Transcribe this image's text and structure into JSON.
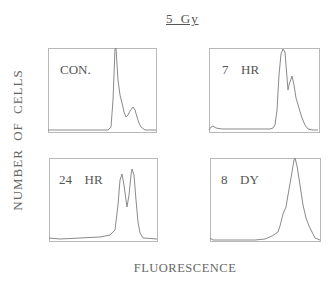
{
  "figure": {
    "title": "5 Gy",
    "ylabel": "NUMBER OF CELLS",
    "xlabel": "FLUORESCENCE"
  },
  "panels": [
    {
      "label": "CON.",
      "box": [
        48,
        48,
        108,
        84
      ]
    },
    {
      "label": "7  HR",
      "box": [
        209,
        48,
        110,
        84
      ]
    },
    {
      "label": "24  HR",
      "box": [
        49,
        158,
        108,
        83
      ]
    },
    {
      "label": "8  DY",
      "box": [
        210,
        158,
        110,
        83
      ]
    }
  ],
  "chart_data": [
    {
      "type": "line",
      "title": "CON.",
      "xlabel": "FLUORESCENCE",
      "ylabel": "NUMBER OF CELLS",
      "grid": false,
      "x": [
        0,
        50,
        58,
        60,
        62,
        64,
        66,
        68,
        70,
        72,
        74,
        76,
        78,
        80,
        82,
        84,
        86,
        88,
        90,
        92,
        95,
        100
      ],
      "y": [
        0,
        0,
        2,
        40,
        100,
        80,
        50,
        40,
        25,
        16,
        15,
        20,
        28,
        30,
        26,
        18,
        10,
        5,
        3,
        1,
        0,
        0
      ],
      "path_px": [
        [
          48,
          130
        ],
        [
          108,
          130
        ],
        [
          111,
          127
        ],
        [
          113,
          100
        ],
        [
          115,
          49
        ],
        [
          116,
          48
        ],
        [
          118,
          80
        ],
        [
          120,
          95
        ],
        [
          122,
          103
        ],
        [
          124,
          112
        ],
        [
          126,
          117
        ],
        [
          128,
          115
        ],
        [
          130,
          111
        ],
        [
          133,
          107
        ],
        [
          135,
          110
        ],
        [
          137,
          117
        ],
        [
          139,
          123
        ],
        [
          141,
          127
        ],
        [
          145,
          130
        ],
        [
          156,
          130
        ]
      ]
    },
    {
      "type": "line",
      "title": "7 HR",
      "xlabel": "FLUORESCENCE",
      "ylabel": "NUMBER OF CELLS",
      "grid": false,
      "x": [
        0,
        2,
        5,
        10,
        55,
        60,
        61,
        63,
        65,
        67,
        68,
        70,
        72,
        74,
        76,
        78,
        80,
        82,
        85,
        88,
        92,
        100
      ],
      "y": [
        2,
        4,
        2,
        1,
        2,
        5,
        40,
        90,
        100,
        97,
        60,
        50,
        65,
        68,
        55,
        45,
        35,
        25,
        12,
        4,
        0,
        0
      ],
      "path_px": [
        [
          209,
          130
        ],
        [
          211,
          127
        ],
        [
          213,
          126
        ],
        [
          216,
          128
        ],
        [
          222,
          129
        ],
        [
          270,
          129
        ],
        [
          273,
          128
        ],
        [
          275,
          125
        ],
        [
          277,
          110
        ],
        [
          279,
          75
        ],
        [
          281,
          54
        ],
        [
          283,
          49
        ],
        [
          285,
          52
        ],
        [
          286,
          65
        ],
        [
          288,
          90
        ],
        [
          289,
          85
        ],
        [
          291,
          79
        ],
        [
          292,
          76
        ],
        [
          294,
          85
        ],
        [
          296,
          98
        ],
        [
          299,
          108
        ],
        [
          302,
          118
        ],
        [
          305,
          125
        ],
        [
          308,
          129
        ],
        [
          312,
          130
        ],
        [
          318,
          130
        ]
      ]
    },
    {
      "type": "line",
      "title": "24 HR",
      "xlabel": "FLUORESCENCE",
      "ylabel": "NUMBER OF CELLS",
      "grid": false,
      "x": [
        0,
        55,
        62,
        66,
        68,
        70,
        72,
        74,
        76,
        78,
        80,
        82,
        84,
        86,
        88,
        90,
        94,
        100
      ],
      "y": [
        0,
        1,
        5,
        40,
        80,
        95,
        70,
        45,
        60,
        90,
        100,
        85,
        55,
        20,
        6,
        2,
        0,
        0
      ],
      "path_px": [
        [
          49,
          238
        ],
        [
          60,
          239
        ],
        [
          100,
          237
        ],
        [
          110,
          235
        ],
        [
          115,
          230
        ],
        [
          118,
          205
        ],
        [
          120,
          180
        ],
        [
          122,
          174
        ],
        [
          124,
          185
        ],
        [
          126,
          200
        ],
        [
          127,
          207
        ],
        [
          129,
          195
        ],
        [
          131,
          175
        ],
        [
          132,
          169
        ],
        [
          134,
          175
        ],
        [
          136,
          200
        ],
        [
          138,
          222
        ],
        [
          140,
          233
        ],
        [
          143,
          238
        ],
        [
          157,
          239
        ]
      ]
    },
    {
      "type": "line",
      "title": "8 DY",
      "xlabel": "FLUORESCENCE",
      "ylabel": "NUMBER OF CELLS",
      "grid": false,
      "x": [
        0,
        40,
        55,
        60,
        65,
        68,
        70,
        72,
        74,
        76,
        78,
        80,
        82,
        84,
        86,
        88,
        90,
        94,
        100
      ],
      "y": [
        1,
        1,
        4,
        8,
        30,
        45,
        60,
        85,
        100,
        90,
        70,
        45,
        30,
        18,
        10,
        6,
        3,
        1,
        0
      ],
      "path_px": [
        [
          210,
          238
        ],
        [
          213,
          240
        ],
        [
          220,
          240
        ],
        [
          255,
          240
        ],
        [
          265,
          239
        ],
        [
          272,
          236
        ],
        [
          278,
          232
        ],
        [
          280,
          226
        ],
        [
          283,
          214
        ],
        [
          286,
          207
        ],
        [
          288,
          195
        ],
        [
          291,
          178
        ],
        [
          294,
          160
        ],
        [
          295,
          158
        ],
        [
          297,
          166
        ],
        [
          300,
          185
        ],
        [
          303,
          205
        ],
        [
          306,
          218
        ],
        [
          309,
          226
        ],
        [
          312,
          232
        ],
        [
          315,
          238
        ],
        [
          320,
          240
        ]
      ]
    }
  ]
}
